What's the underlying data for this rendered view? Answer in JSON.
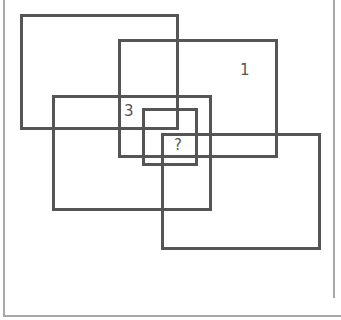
{
  "diagram": {
    "stroke_color": "#555555",
    "frame_color": "#a8a8a8",
    "rectangles": [
      {
        "id": "A",
        "x": 20,
        "y": 14,
        "w": 159,
        "h": 116
      },
      {
        "id": "B",
        "x": 118,
        "y": 39,
        "w": 160,
        "h": 119
      },
      {
        "id": "C",
        "x": 52,
        "y": 95,
        "w": 160,
        "h": 116
      },
      {
        "id": "D",
        "x": 142,
        "y": 108,
        "w": 56,
        "h": 58
      },
      {
        "id": "E",
        "x": 161,
        "y": 133,
        "w": 160,
        "h": 117
      }
    ],
    "labels": [
      {
        "text": "1",
        "x": 240,
        "y": 63
      },
      {
        "text": "3",
        "x": 124,
        "y": 104
      },
      {
        "text": "?",
        "x": 174,
        "y": 138
      }
    ]
  }
}
